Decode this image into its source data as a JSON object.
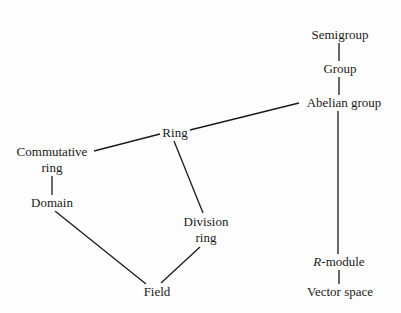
{
  "diagram": {
    "type": "hasse-diagram",
    "nodes": [
      {
        "id": "semigroup",
        "label": "Semigroup"
      },
      {
        "id": "group",
        "label": "Group"
      },
      {
        "id": "abelian_group",
        "label": "Abelian group"
      },
      {
        "id": "ring",
        "label": "Ring"
      },
      {
        "id": "commutative_ring",
        "label_line1": "Commutative",
        "label_line2": "ring"
      },
      {
        "id": "domain",
        "label": "Domain"
      },
      {
        "id": "division_ring",
        "label_line1": "Division",
        "label_line2": "ring"
      },
      {
        "id": "field",
        "label": "Field"
      },
      {
        "id": "r_module",
        "label_italic": "R",
        "label_rest": "-module"
      },
      {
        "id": "vector_space",
        "label": "Vector space"
      }
    ],
    "edges": [
      [
        "semigroup",
        "group"
      ],
      [
        "group",
        "abelian_group"
      ],
      [
        "abelian_group",
        "ring"
      ],
      [
        "abelian_group",
        "r_module"
      ],
      [
        "ring",
        "commutative_ring"
      ],
      [
        "ring",
        "division_ring"
      ],
      [
        "commutative_ring",
        "domain"
      ],
      [
        "domain",
        "field"
      ],
      [
        "division_ring",
        "field"
      ],
      [
        "r_module",
        "vector_space"
      ]
    ]
  }
}
